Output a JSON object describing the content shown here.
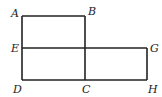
{
  "diagram": {
    "type": "geometric-figure",
    "points": {
      "A": {
        "label": "A",
        "x": 22,
        "y": 16
      },
      "B": {
        "label": "B",
        "x": 85,
        "y": 16
      },
      "C": {
        "label": "C",
        "x": 85,
        "y": 80
      },
      "D": {
        "label": "D",
        "x": 22,
        "y": 80
      },
      "E": {
        "label": "E",
        "x": 22,
        "y": 48
      },
      "G": {
        "label": "G",
        "x": 147,
        "y": 48
      },
      "H": {
        "label": "H",
        "x": 147,
        "y": 80
      }
    },
    "segments": [
      [
        "A",
        "B"
      ],
      [
        "B",
        "C"
      ],
      [
        "A",
        "D"
      ],
      [
        "D",
        "H"
      ],
      [
        "E",
        "G"
      ],
      [
        "G",
        "H"
      ]
    ],
    "colors": {
      "stroke": "#222222",
      "background": "#ffffff"
    }
  }
}
